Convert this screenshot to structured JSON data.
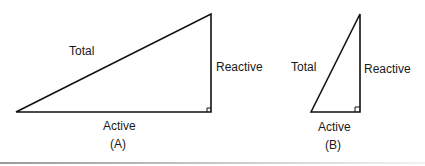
{
  "diagram": {
    "figure_a": {
      "caption": "(A)",
      "hypotenuse_label": "Total",
      "vertical_label": "Reactive",
      "base_label": "Active"
    },
    "figure_b": {
      "caption": "(B)",
      "hypotenuse_label": "Total",
      "vertical_label": "Reactive",
      "base_label": "Active"
    }
  }
}
